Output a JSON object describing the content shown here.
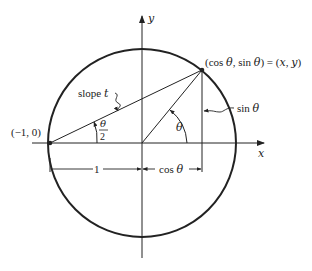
{
  "figure": {
    "colors": {
      "ink": "#222222",
      "background": "#ffffff"
    },
    "axes": {
      "x_label": "x",
      "y_label": "y"
    },
    "labels": {
      "left_point": "(−1, 0)",
      "point_p": "(cos θ, sin θ) = (x, y)",
      "slope": "slope t",
      "sin": "sin θ",
      "theta": "θ",
      "half_theta_num": "θ",
      "half_theta_den": "2",
      "one": "1",
      "cos": "cos θ"
    }
  }
}
